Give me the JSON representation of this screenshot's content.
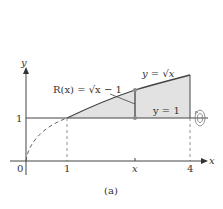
{
  "figure": {
    "caption": "(a)",
    "axes": {
      "x_label": "x",
      "y_label": "y",
      "origin_label": "0",
      "x_ticks": [
        "1",
        "x",
        "4"
      ],
      "y_ticks": [
        "1"
      ]
    },
    "labels": {
      "curve": "y = √x",
      "line": "y = 1",
      "radius": "R(x) = √x − 1"
    },
    "icons": [
      "rotation-arrow-icon"
    ],
    "colors": {
      "region_fill": "#e2e2e2",
      "line": "#555555",
      "dot": "#8a8a8a"
    }
  }
}
